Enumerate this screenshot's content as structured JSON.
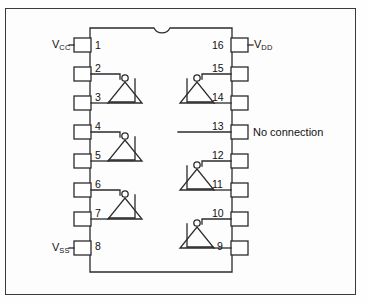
{
  "diagram": {
    "type": "ic-pinout",
    "package": {
      "pin_count": 16,
      "notch": "top-center-semicircle"
    },
    "line_color": "#2b2b2b",
    "text_color": "#111111",
    "background": "#fdfdfd",
    "pins": [
      {
        "number": "1",
        "side": "left",
        "label": "V",
        "sub": "CC"
      },
      {
        "number": "2",
        "side": "left",
        "label": "",
        "sub": ""
      },
      {
        "number": "3",
        "side": "left",
        "label": "",
        "sub": ""
      },
      {
        "number": "4",
        "side": "left",
        "label": "",
        "sub": ""
      },
      {
        "number": "5",
        "side": "left",
        "label": "",
        "sub": ""
      },
      {
        "number": "6",
        "side": "left",
        "label": "",
        "sub": ""
      },
      {
        "number": "7",
        "side": "left",
        "label": "",
        "sub": ""
      },
      {
        "number": "8",
        "side": "left",
        "label": "V",
        "sub": "SS"
      },
      {
        "number": "9",
        "side": "right",
        "label": "",
        "sub": ""
      },
      {
        "number": "10",
        "side": "right",
        "label": "",
        "sub": ""
      },
      {
        "number": "11",
        "side": "right",
        "label": "",
        "sub": ""
      },
      {
        "number": "12",
        "side": "right",
        "label": "",
        "sub": ""
      },
      {
        "number": "13",
        "side": "right",
        "label": "No connection",
        "sub": ""
      },
      {
        "number": "14",
        "side": "right",
        "label": "",
        "sub": ""
      },
      {
        "number": "15",
        "side": "right",
        "label": "",
        "sub": ""
      },
      {
        "number": "16",
        "side": "right",
        "label": "V",
        "sub": "DD"
      }
    ],
    "labels": {
      "vcc_main": "V",
      "vcc_sub": "CC",
      "vss_main": "V",
      "vss_sub": "SS",
      "vdd_main": "V",
      "vdd_sub": "DD",
      "no_connection": "No connection"
    },
    "pin_numbers": {
      "p1": "1",
      "p2": "2",
      "p3": "3",
      "p4": "4",
      "p5": "5",
      "p6": "6",
      "p7": "7",
      "p8": "8",
      "p9": "9",
      "p10": "10",
      "p11": "11",
      "p12": "12",
      "p13": "13",
      "p14": "14",
      "p15": "15",
      "p16": "16"
    },
    "gates": [
      {
        "name": "inverter-1",
        "input_pin": "2",
        "output_pin": "3",
        "side": "left",
        "symbol": "not-gate"
      },
      {
        "name": "inverter-2",
        "input_pin": "4",
        "output_pin": "5",
        "side": "left",
        "symbol": "not-gate"
      },
      {
        "name": "inverter-3",
        "input_pin": "6",
        "output_pin": "7",
        "side": "left",
        "symbol": "not-gate"
      },
      {
        "name": "inverter-4",
        "input_pin": "15",
        "output_pin": "14",
        "side": "right",
        "symbol": "not-gate"
      },
      {
        "name": "inverter-5",
        "input_pin": "12",
        "output_pin": "11",
        "side": "right",
        "symbol": "not-gate"
      },
      {
        "name": "inverter-6",
        "input_pin": "10",
        "output_pin": "9",
        "side": "right",
        "symbol": "not-gate"
      }
    ]
  }
}
